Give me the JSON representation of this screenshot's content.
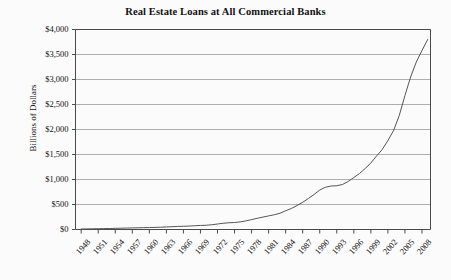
{
  "chart_data": {
    "type": "line",
    "title": "Real Estate Loans at All Commercial Banks",
    "xlabel": "",
    "ylabel": "Billions of Dollars",
    "ylim": [
      0,
      4000
    ],
    "xlim": [
      1947,
      2009.5
    ],
    "grid": true,
    "legend": "none",
    "line_color": "#555555",
    "gridline_color": "#9a9a9a",
    "axis_color": "#4a4a4a",
    "background_color": "#fbfbfb",
    "ytick_values": [
      0,
      500,
      1000,
      1500,
      2000,
      2500,
      3000,
      3500,
      4000
    ],
    "ytick_labels": [
      "$0",
      "$500",
      "$1,000",
      "$1,500",
      "$2,000",
      "$2,500",
      "$3,000",
      "$3,500",
      "$4,000"
    ],
    "xtick_values": [
      1948,
      1951,
      1954,
      1957,
      1960,
      1963,
      1966,
      1969,
      1972,
      1975,
      1978,
      1981,
      1984,
      1987,
      1990,
      1993,
      1996,
      1999,
      2002,
      2005,
      2008
    ],
    "xtick_labels": [
      "1948",
      "1951",
      "1954",
      "1957",
      "1960",
      "1963",
      "1966",
      "1969",
      "1972",
      "1975",
      "1978",
      "1981",
      "1984",
      "1987",
      "1990",
      "1993",
      "1996",
      "1999",
      "2002",
      "2005",
      "2008"
    ],
    "series": [
      {
        "name": "Real Estate Loans at All Commercial Banks",
        "x": [
          1948,
          1949,
          1950,
          1951,
          1952,
          1953,
          1954,
          1955,
          1956,
          1957,
          1958,
          1959,
          1960,
          1961,
          1962,
          1963,
          1964,
          1965,
          1966,
          1967,
          1968,
          1969,
          1970,
          1971,
          1972,
          1973,
          1974,
          1975,
          1976,
          1977,
          1978,
          1979,
          1980,
          1981,
          1982,
          1983,
          1984,
          1985,
          1986,
          1987,
          1988,
          1989,
          1990,
          1991,
          1992,
          1993,
          1994,
          1995,
          1996,
          1997,
          1998,
          1999,
          2000,
          2001,
          2002,
          2003,
          2004,
          2005,
          2006,
          2007,
          2008,
          2009
        ],
        "values": [
          10,
          12,
          14,
          16,
          18,
          20,
          23,
          26,
          29,
          31,
          34,
          37,
          39,
          42,
          46,
          51,
          56,
          61,
          65,
          69,
          75,
          81,
          85,
          95,
          110,
          125,
          135,
          140,
          152,
          172,
          198,
          224,
          248,
          272,
          295,
          325,
          375,
          420,
          480,
          545,
          620,
          700,
          790,
          845,
          870,
          875,
          900,
          960,
          1040,
          1120,
          1220,
          1330,
          1470,
          1600,
          1780,
          1980,
          2280,
          2680,
          3050,
          3350,
          3580,
          3800
        ]
      }
    ],
    "annotations": []
  }
}
